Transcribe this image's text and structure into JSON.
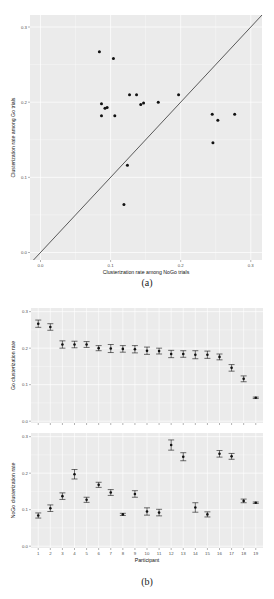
{
  "captions": {
    "a": "(a)",
    "b": "(b)"
  },
  "colors": {
    "panel_bg": "#ebebeb",
    "grid": "#ffffff",
    "point": "#111111",
    "diagonal": "#333333",
    "tick_text": "#4d4d4d",
    "axis_title": "#111111"
  },
  "chart_data": [
    {
      "id": "a",
      "type": "scatter",
      "title": "",
      "xlabel": "Clusterization rate among NoGo trials",
      "ylabel": "Clusterization rate among Go trials",
      "xlim": [
        -0.015,
        0.316
      ],
      "ylim": [
        -0.01,
        0.316
      ],
      "xticks": [
        0.0,
        0.1,
        0.2,
        0.3
      ],
      "yticks": [
        0.0,
        0.1,
        0.2,
        0.3
      ],
      "xtick_labels": [
        "0.0",
        "0.1",
        "0.2",
        "0.3"
      ],
      "ytick_labels": [
        "0.0",
        "0.1",
        "0.2",
        "0.3"
      ],
      "grid": true,
      "reference_line": "y = x",
      "points": [
        {
          "x": 0.084,
          "y": 0.267
        },
        {
          "x": 0.104,
          "y": 0.258
        },
        {
          "x": 0.137,
          "y": 0.21
        },
        {
          "x": 0.197,
          "y": 0.21
        },
        {
          "x": 0.127,
          "y": 0.21
        },
        {
          "x": 0.168,
          "y": 0.2
        },
        {
          "x": 0.147,
          "y": 0.199
        },
        {
          "x": 0.087,
          "y": 0.198
        },
        {
          "x": 0.143,
          "y": 0.197
        },
        {
          "x": 0.095,
          "y": 0.193
        },
        {
          "x": 0.092,
          "y": 0.192
        },
        {
          "x": 0.277,
          "y": 0.184
        },
        {
          "x": 0.245,
          "y": 0.184
        },
        {
          "x": 0.106,
          "y": 0.182
        },
        {
          "x": 0.087,
          "y": 0.182
        },
        {
          "x": 0.253,
          "y": 0.176
        },
        {
          "x": 0.246,
          "y": 0.146
        },
        {
          "x": 0.124,
          "y": 0.116
        },
        {
          "x": 0.119,
          "y": 0.064
        }
      ]
    },
    {
      "id": "b-top",
      "type": "errorbar",
      "title": "",
      "xlabel": "",
      "ylabel": "Go clusterization rate",
      "ylim": [
        -0.005,
        0.31
      ],
      "yticks": [
        0.0,
        0.1,
        0.2,
        0.3
      ],
      "ytick_labels": [
        "0.0",
        "0.1",
        "0.2",
        "0.3"
      ],
      "categories": [
        "1",
        "2",
        "3",
        "4",
        "5",
        "6",
        "7",
        "8",
        "9",
        "10",
        "11",
        "12",
        "13",
        "14",
        "15",
        "16",
        "17",
        "18",
        "19"
      ],
      "values": [
        0.267,
        0.258,
        0.21,
        0.21,
        0.21,
        0.2,
        0.199,
        0.198,
        0.197,
        0.193,
        0.192,
        0.184,
        0.184,
        0.182,
        0.182,
        0.176,
        0.146,
        0.116,
        0.064
      ],
      "errors": [
        0.01,
        0.009,
        0.01,
        0.009,
        0.008,
        0.007,
        0.011,
        0.009,
        0.01,
        0.01,
        0.008,
        0.01,
        0.009,
        0.011,
        0.01,
        0.008,
        0.009,
        0.008,
        0.002
      ],
      "grid": true
    },
    {
      "id": "b-bottom",
      "type": "errorbar",
      "title": "",
      "xlabel": "Participant",
      "ylabel": "NoGo clusterization rate",
      "ylim": [
        -0.005,
        0.31
      ],
      "yticks": [
        0.0,
        0.1,
        0.2,
        0.3
      ],
      "ytick_labels": [
        "0.0",
        "0.1",
        "0.2",
        "0.3"
      ],
      "categories": [
        "1",
        "2",
        "3",
        "4",
        "5",
        "6",
        "7",
        "8",
        "9",
        "10",
        "11",
        "12",
        "13",
        "14",
        "15",
        "16",
        "17",
        "18",
        "19"
      ],
      "values": [
        0.084,
        0.104,
        0.137,
        0.197,
        0.127,
        0.168,
        0.147,
        0.087,
        0.143,
        0.095,
        0.092,
        0.277,
        0.245,
        0.106,
        0.087,
        0.253,
        0.246,
        0.124,
        0.119
      ],
      "errors": [
        0.007,
        0.009,
        0.009,
        0.013,
        0.007,
        0.007,
        0.008,
        0.003,
        0.009,
        0.01,
        0.009,
        0.014,
        0.011,
        0.013,
        0.007,
        0.009,
        0.008,
        0.005,
        0.002
      ],
      "grid": true
    }
  ]
}
